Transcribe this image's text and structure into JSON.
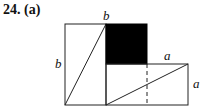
{
  "problem": {
    "number": "24.",
    "part": "(a)"
  },
  "figure": {
    "labels": {
      "top_b": "b",
      "left_b": "b",
      "right_a_top": "a",
      "right_a_side": "a"
    },
    "fill_color": "#000000",
    "line_color": "#222222"
  }
}
